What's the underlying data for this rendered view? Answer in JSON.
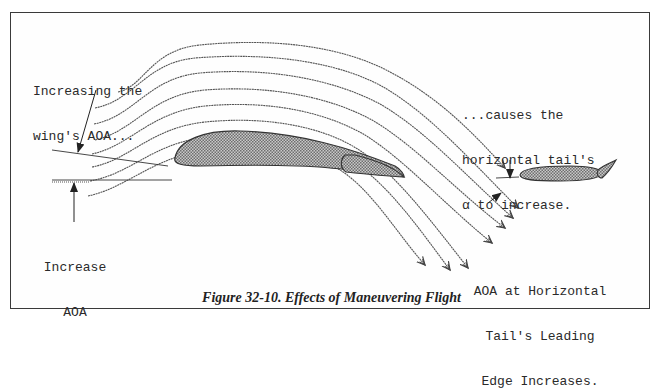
{
  "figure": {
    "caption": "Figure 32-10. Effects of Maneuvering Flight",
    "annotations": {
      "wing_aoa": {
        "line1": "Increasing the",
        "line2": "wing's AOA..."
      },
      "increase_aoa": {
        "line1": "Increase",
        "line2": "AOA"
      },
      "tail_alpha": {
        "line1": "...causes the",
        "line2": "horizontal tail's",
        "line3": "α to increase."
      },
      "tail_leading_edge": {
        "line1": "AOA at Horizontal",
        "line2": "Tail's Leading",
        "line3": "Edge Increases."
      }
    },
    "elements": {
      "wing": "wing-airfoil",
      "wing_flap": "trailing-edge-flap",
      "tail": "horizontal-tail-airfoil",
      "tail_elevator": "elevator",
      "streamline_count": 10
    },
    "colors": {
      "line": "#3a3a3a",
      "airfoil_fill": "#9a9a9a",
      "background": "#ffffff"
    }
  }
}
